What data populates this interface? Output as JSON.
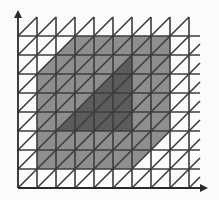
{
  "diagram": {
    "width": 219,
    "height": 200,
    "colors": {
      "background": "#fbfbfb",
      "grid_line": "#3c3c3c",
      "outer_region": "#8e8e8e",
      "inner_region": "#5c5c5c",
      "axis": "#2a2a2a"
    },
    "grid": {
      "origin_x": 18,
      "origin_y": 188,
      "cell": 19,
      "columns": 9,
      "rows": 9,
      "overhang_right": 11,
      "diagonal_direction": "bottom-left to top-right"
    },
    "axes": {
      "y_arrow_tip": [
        18,
        10
      ],
      "x_arrow_tip": [
        208,
        188
      ]
    },
    "regions": {
      "outer_region": {
        "shade": "medium gray",
        "polygon": [
          [
            75,
            36
          ],
          [
            170,
            36
          ],
          [
            170,
            131
          ],
          [
            132,
            169
          ],
          [
            37,
            169
          ],
          [
            37,
            74
          ]
        ]
      },
      "inner_region": {
        "shade": "dark gray",
        "polygon": [
          [
            56,
            131
          ],
          [
            132,
            131
          ],
          [
            132,
            55
          ]
        ]
      }
    }
  }
}
